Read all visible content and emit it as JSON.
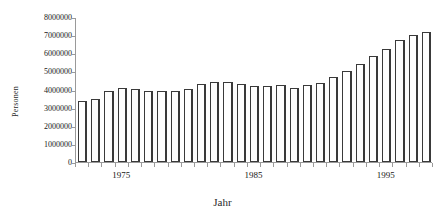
{
  "chart_data": {
    "type": "bar",
    "title": "",
    "xlabel": "Jahr",
    "ylabel": "Personen",
    "ylim": [
      0,
      8000000
    ],
    "ytick_values": [
      0,
      1000000,
      2000000,
      3000000,
      4000000,
      5000000,
      6000000,
      7000000,
      8000000
    ],
    "ytick_labels": [
      "0",
      "1000000",
      "2000000",
      "3000000",
      "4000000",
      "5000000",
      "6000000",
      "7000000",
      "8000000"
    ],
    "xtick_labels": [
      "1975",
      "1985",
      "1995"
    ],
    "xtick_years": [
      1975,
      1985,
      1995
    ],
    "grid": false,
    "legend": null,
    "bar_color": "#ffffff",
    "bar_edge_color": "#3a3a3a",
    "axis_color": "#9a9a9a",
    "categories": [
      "1972",
      "1973",
      "1974",
      "1975",
      "1976",
      "1977",
      "1978",
      "1979",
      "1980",
      "1981",
      "1982",
      "1983",
      "1984",
      "1985",
      "1986",
      "1987",
      "1988",
      "1989",
      "1990",
      "1991",
      "1992",
      "1993",
      "1994",
      "1995",
      "1996",
      "1997",
      "1998"
    ],
    "values": [
      3400000,
      3480000,
      3970000,
      4100000,
      4050000,
      3930000,
      3950000,
      3930000,
      4050000,
      4350000,
      4450000,
      4460000,
      4340000,
      4230000,
      4240000,
      4270000,
      4130000,
      4280000,
      4400000,
      4750000,
      5050000,
      5450000,
      5880000,
      6280000,
      6800000,
      7050000,
      7200000
    ]
  }
}
